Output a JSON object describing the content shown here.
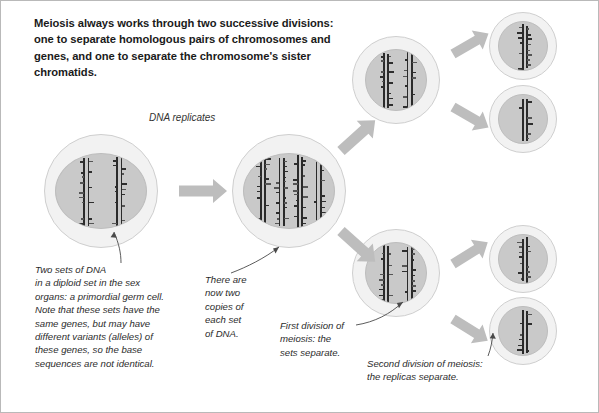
{
  "figure": {
    "heading": "Meiosis always works through two successive divisions: one to separate homologous pairs of chromosomes and genes, and one to separate the chromosome's sister chromatids.",
    "stage_label_dna_replicates": "DNA replicates",
    "captions": {
      "two_sets": "Two sets of DNA\nin a diploid set in the sex\norgans: a primordial germ cell.\nNote that these sets have the\nsame genes, but may have\ndifferent variants (alleles) of\nthese genes, so the base\nsequences are not identical.",
      "there_are_now": "There are\nnow two\ncopies of\neach set\nof DNA.",
      "first_division": "First division of\nmeiosis: the\nsets separate.",
      "second_division": "Second division of meiosis:\nthe replicas separate."
    },
    "colors": {
      "membrane": "#f2f2f2",
      "membrane_outline": "#cfcfcf",
      "nucleus": "#c9c9c9",
      "chromosome": "#2a2a2a",
      "arrow": "#bdbdbd",
      "frame": "#b9b9b9",
      "text": "#1a1a1a"
    },
    "cells": [
      {
        "name": "parent-germ-cell",
        "chromosome_bars": 4
      },
      {
        "name": "replicated-cell",
        "chromosome_bars": 8
      },
      {
        "name": "meiosis-I-cell-top",
        "chromosome_bars": 4
      },
      {
        "name": "meiosis-I-cell-bottom",
        "chromosome_bars": 4
      },
      {
        "name": "gamete-top-1",
        "chromosome_bars": 2
      },
      {
        "name": "gamete-top-2",
        "chromosome_bars": 2
      },
      {
        "name": "gamete-bottom-1",
        "chromosome_bars": 2
      },
      {
        "name": "gamete-bottom-2",
        "chromosome_bars": 2
      }
    ],
    "arrows": [
      {
        "name": "arrow-replication"
      },
      {
        "name": "arrow-meiosis1-up"
      },
      {
        "name": "arrow-meiosis1-down"
      },
      {
        "name": "arrow-meiosis2-top-up"
      },
      {
        "name": "arrow-meiosis2-top-down"
      },
      {
        "name": "arrow-meiosis2-bottom-up"
      },
      {
        "name": "arrow-meiosis2-bottom-down"
      }
    ]
  }
}
